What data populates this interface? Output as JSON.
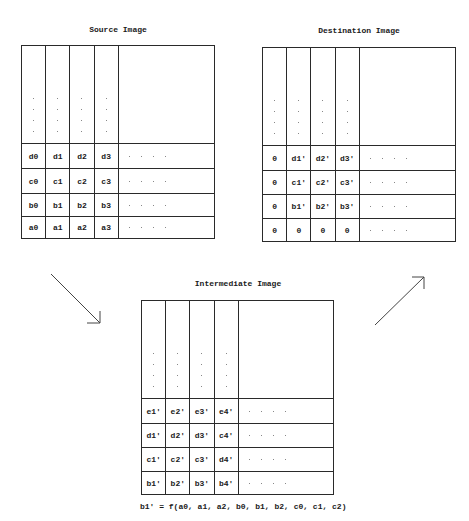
{
  "corner_label": "",
  "source": {
    "title": "Source Image",
    "rows": [
      [
        "d0",
        "d1",
        "d2",
        "d3"
      ],
      [
        "c0",
        "c1",
        "c2",
        "c3"
      ],
      [
        "b0",
        "b1",
        "b2",
        "b3"
      ],
      [
        "a0",
        "a1",
        "a2",
        "a3"
      ]
    ]
  },
  "destination": {
    "title": "Destination Image",
    "rows": [
      [
        "0",
        "d1'",
        "d2'",
        "d3'"
      ],
      [
        "0",
        "c1'",
        "c2'",
        "c3'"
      ],
      [
        "0",
        "b1'",
        "b2'",
        "b3'"
      ],
      [
        "0",
        "0",
        "0",
        "0"
      ]
    ]
  },
  "intermediate": {
    "title": "Intermediate Image",
    "rows": [
      [
        "e1'",
        "e2'",
        "e3'",
        "e4'"
      ],
      [
        "d1'",
        "d2'",
        "d3'",
        "c4'"
      ],
      [
        "c1'",
        "c2'",
        "c3'",
        "d4'"
      ],
      [
        "b1'",
        "b2'",
        "b3'",
        "b4'"
      ]
    ]
  },
  "formula": "b1' = f(a0, a1, a2, b0, b1, b2, c0, c1, c2)",
  "arrows": [
    {
      "name": "source-to-intermediate",
      "direction": "down-right"
    },
    {
      "name": "intermediate-to-destination",
      "direction": "up-right"
    }
  ],
  "colors": {
    "line": "#2a2a2a",
    "dots": "#888888",
    "background": "#ffffff"
  }
}
